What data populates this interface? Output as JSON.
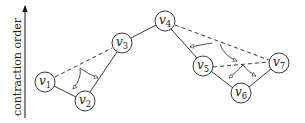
{
  "axis": {
    "label": "contraction order",
    "direction": "up"
  },
  "nodes": [
    {
      "id": "v1",
      "base": "v",
      "sub": "1",
      "x": 45,
      "y": 82
    },
    {
      "id": "v2",
      "base": "v",
      "sub": "2",
      "x": 85,
      "y": 101
    },
    {
      "id": "v3",
      "base": "v",
      "sub": "3",
      "x": 122,
      "y": 43
    },
    {
      "id": "v4",
      "base": "v",
      "sub": "4",
      "x": 165,
      "y": 21
    },
    {
      "id": "v5",
      "base": "v",
      "sub": "5",
      "x": 203,
      "y": 66
    },
    {
      "id": "v6",
      "base": "v",
      "sub": "6",
      "x": 241,
      "y": 93
    },
    {
      "id": "v7",
      "base": "v",
      "sub": "7",
      "x": 279,
      "y": 63
    }
  ],
  "edges": [
    {
      "from": "v1",
      "to": "v2"
    },
    {
      "from": "v2",
      "to": "v3"
    },
    {
      "from": "v3",
      "to": "v4"
    },
    {
      "from": "v4",
      "to": "v5"
    },
    {
      "from": "v5",
      "to": "v6"
    },
    {
      "from": "v6",
      "to": "v7"
    }
  ],
  "shortcuts": [
    {
      "from": "v1",
      "to": "v3"
    },
    {
      "from": "v4",
      "to": "v7"
    },
    {
      "from": "v5",
      "to": "v7"
    }
  ]
}
